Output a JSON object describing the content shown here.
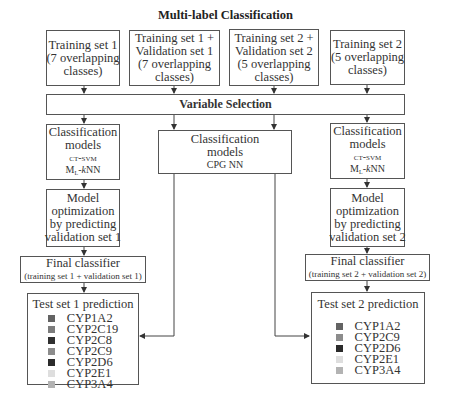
{
  "title": "Multi-label Classification",
  "top_boxes": [
    {
      "lines": [
        "Training set 1",
        "(7 overlapping",
        "classes)"
      ]
    },
    {
      "lines": [
        "Training set 1 +",
        "Validation set 1",
        "(7 overlapping",
        "classes)"
      ]
    },
    {
      "lines": [
        "Training set 2 +",
        "Validation set 2",
        "(5 overlapping",
        "classes)"
      ]
    },
    {
      "lines": [
        "Training set 2",
        "(5 overlapping",
        "classes)"
      ]
    }
  ],
  "variable_selection": "Variable Selection",
  "left_branch": {
    "classification": {
      "line1": "Classification",
      "line2": "models",
      "model1": "ct-svm",
      "model2_prefix": "M",
      "model2_sub": "L",
      "model2_dash": "-",
      "model2_k": "k",
      "model2_suffix": "NN"
    },
    "optimization": {
      "lines": [
        "Model",
        "optimization",
        "by predicting",
        "validation set 1"
      ]
    },
    "final": {
      "title": "Final classifier",
      "subtitle": "(training set 1 + validation set 1)"
    },
    "prediction": {
      "title": "Test set 1 prediction",
      "legend": [
        {
          "label": "CYP1A2",
          "color": "#636363"
        },
        {
          "label": "CYP2C19",
          "color": "#7c7c7c"
        },
        {
          "label": "CYP2C8",
          "color": "#303030"
        },
        {
          "label": "CYP2C9",
          "color": "#8c8c8c"
        },
        {
          "label": "CYP2D6",
          "color": "#2b2b2b"
        },
        {
          "label": "CYP2E1",
          "color": "#dedede"
        },
        {
          "label": "CYP3A4",
          "color": "#b3b3b3"
        }
      ]
    }
  },
  "center_branch": {
    "classification": {
      "line1": "Classification",
      "line2": "models",
      "model1": "CPG NN"
    }
  },
  "right_branch": {
    "classification": {
      "line1": "Classification",
      "line2": "models",
      "model1": "ct-svm",
      "model2_prefix": "M",
      "model2_sub": "L",
      "model2_dash": "-",
      "model2_k": "k",
      "model2_suffix": "NN"
    },
    "optimization": {
      "lines": [
        "Model",
        "optimization",
        "by predicting",
        "validation set 2"
      ]
    },
    "final": {
      "title": "Final classifier",
      "subtitle": "(training set 2 + validation set 2)"
    },
    "prediction": {
      "title": "Test set 2 prediction",
      "legend": [
        {
          "label": "CYP1A2",
          "color": "#636363"
        },
        {
          "label": "CYP2C9",
          "color": "#8c8c8c"
        },
        {
          "label": "CYP2D6",
          "color": "#2b2b2b"
        },
        {
          "label": "CYP2E1",
          "color": "#dedede"
        },
        {
          "label": "CYP3A4",
          "color": "#b3b3b3"
        }
      ]
    }
  },
  "colors": {
    "border": "#555555",
    "text": "#333333",
    "background": "#ffffff"
  }
}
